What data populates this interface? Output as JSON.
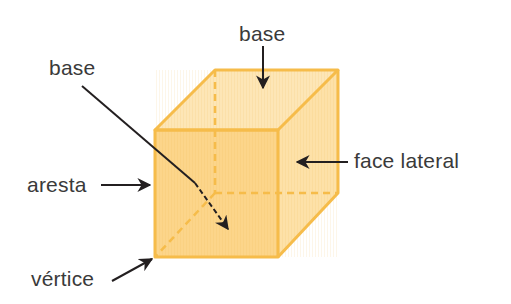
{
  "diagram": {
    "labels": {
      "base_top": "base",
      "base_bottom": "base",
      "face_lateral": "face lateral",
      "aresta": "aresta",
      "vertice": "vértice"
    },
    "colors": {
      "face_fill_front": "#FCD58A",
      "face_fill_top": "#FDE6B6",
      "face_fill_right": "#FDE1A8",
      "edge": "#F6BC4A",
      "arrow": "#231f20",
      "text": "#3a3a3a",
      "background": "#ffffff"
    },
    "shape": "cube"
  }
}
